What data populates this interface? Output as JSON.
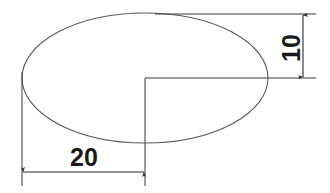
{
  "drawing": {
    "title": "Ellipse engineering dimension drawing",
    "background_color": "#ffffff",
    "line_color": "#4a4a4a",
    "dimension_line_color": "#2b2b2b",
    "text_color": "#1a1a1a",
    "shape": {
      "name": "ellipse",
      "center_x": 145,
      "center_y": 78,
      "radius_x": 123,
      "radius_y": 65
    },
    "dimensions": [
      {
        "id": "minor-semi-axis",
        "label": "10",
        "orientation": "vertical",
        "text_rotation_deg": -90,
        "line_x": 303,
        "from_y": 14,
        "to_y": 78,
        "text_x": 296,
        "text_y": 48
      },
      {
        "id": "major-semi-axis",
        "label": "20",
        "orientation": "horizontal",
        "text_rotation_deg": 0,
        "line_y": 172,
        "from_x": 22,
        "to_x": 145,
        "text_x": 84,
        "text_y": 160
      }
    ],
    "extension_lines": [
      {
        "id": "top-extension",
        "x1": 155,
        "y1": 14,
        "x2": 315,
        "y2": 14
      },
      {
        "id": "center-horizontal-extension",
        "x1": 145,
        "y1": 78,
        "x2": 315,
        "y2": 78
      },
      {
        "id": "left-vertical-extension",
        "x1": 22,
        "y1": 74,
        "x2": 22,
        "y2": 185
      },
      {
        "id": "center-vertical-extension",
        "x1": 145,
        "y1": 78,
        "x2": 145,
        "y2": 185
      }
    ]
  }
}
